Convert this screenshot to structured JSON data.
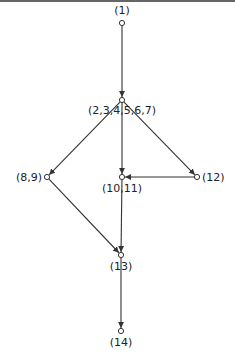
{
  "diagram": {
    "type": "directed-graph",
    "colors": {
      "stroke": "#333333",
      "text": "#222222",
      "background": "#ffffff"
    },
    "nodes": [
      {
        "id": "n1",
        "label": "(1)",
        "x": 122,
        "y": 23,
        "label_x": 122,
        "label_y": 14,
        "anchor": "middle"
      },
      {
        "id": "n2",
        "label": "(2,3,4,5,6,7)",
        "x": 122,
        "y": 100,
        "label_x": 122,
        "label_y": 114,
        "anchor": "middle"
      },
      {
        "id": "n8",
        "label": "(8,9)",
        "x": 47,
        "y": 177,
        "label_x": 42,
        "label_y": 181,
        "anchor": "end"
      },
      {
        "id": "n10",
        "label": "(10,11)",
        "x": 122,
        "y": 177,
        "label_x": 122,
        "label_y": 192,
        "anchor": "middle"
      },
      {
        "id": "n12",
        "label": "(12)",
        "x": 197,
        "y": 177,
        "label_x": 202,
        "label_y": 181,
        "anchor": "start"
      },
      {
        "id": "n13",
        "label": "(13)",
        "x": 121,
        "y": 255,
        "label_x": 121,
        "label_y": 270,
        "anchor": "middle"
      },
      {
        "id": "n14",
        "label": "(14)",
        "x": 121,
        "y": 331,
        "label_x": 121,
        "label_y": 346,
        "anchor": "middle"
      }
    ],
    "edges": [
      {
        "from": "n1",
        "to": "n2"
      },
      {
        "from": "n2",
        "to": "n8"
      },
      {
        "from": "n2",
        "to": "n10"
      },
      {
        "from": "n2",
        "to": "n12"
      },
      {
        "from": "n12",
        "to": "n10"
      },
      {
        "from": "n8",
        "to": "n13"
      },
      {
        "from": "n10",
        "to": "n13"
      },
      {
        "from": "n13",
        "to": "n14"
      }
    ]
  }
}
